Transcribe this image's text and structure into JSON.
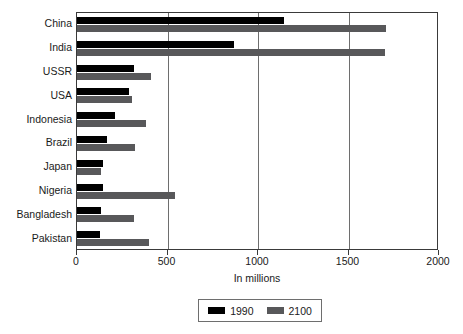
{
  "chart_data": {
    "type": "bar",
    "orientation": "horizontal",
    "title": "",
    "xlabel": "In millions",
    "ylabel": "",
    "xlim": [
      0,
      2000
    ],
    "xticks": [
      0,
      500,
      1000,
      1500,
      2000
    ],
    "xtick_labels": [
      "0",
      "500",
      "1000",
      "1500",
      "2000"
    ],
    "grid": "vertical",
    "legend_position": "bottom-center",
    "categories": [
      "China",
      "India",
      "USSR",
      "USA",
      "Indonesia",
      "Brazil",
      "Japan",
      "Nigeria",
      "Bangladesh",
      "Pakistan"
    ],
    "series": [
      {
        "name": "1990",
        "color": "#000000",
        "values": [
          1144,
          867,
          315,
          287,
          210,
          166,
          144,
          144,
          133,
          127
        ]
      },
      {
        "name": "2100",
        "color": "#58585a",
        "values": [
          1707,
          1700,
          409,
          304,
          381,
          320,
          133,
          541,
          315,
          398
        ]
      }
    ]
  },
  "legend": {
    "entries": [
      {
        "label": "1990"
      },
      {
        "label": "2100"
      }
    ]
  },
  "colors": {
    "series_1990": "#000000",
    "series_2100": "#58585a",
    "axis": "#3a3a3a",
    "gridline": "#6e6e6e",
    "background": "#ffffff"
  }
}
